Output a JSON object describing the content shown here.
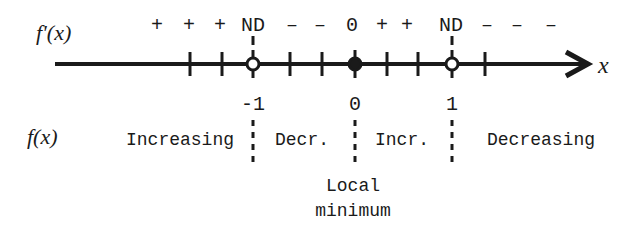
{
  "diagram": {
    "derivative_row_label": "f'(x)",
    "function_row_label": "f(x)",
    "axis_label": "x",
    "sign_row": [
      {
        "text": "+",
        "x": 157
      },
      {
        "text": "+",
        "x": 189
      },
      {
        "text": "+",
        "x": 220
      },
      {
        "text": "ND",
        "x": 253
      },
      {
        "text": "–",
        "x": 292
      },
      {
        "text": "–",
        "x": 320
      },
      {
        "text": "0",
        "x": 352
      },
      {
        "text": "+",
        "x": 382
      },
      {
        "text": "+",
        "x": 407
      },
      {
        "text": "ND",
        "x": 451
      },
      {
        "text": "–",
        "x": 487
      },
      {
        "text": "–",
        "x": 517
      },
      {
        "text": "–",
        "x": 551
      }
    ],
    "ticks_x": [
      190,
      222,
      290,
      322,
      387,
      418,
      485
    ],
    "critical_points": [
      {
        "value": "-1",
        "x": 253,
        "type": "open",
        "fprime": "ND"
      },
      {
        "value": "0",
        "x": 355,
        "type": "filled",
        "fprime": "0"
      },
      {
        "value": "1",
        "x": 452,
        "type": "open",
        "fprime": "ND"
      }
    ],
    "intervals": [
      {
        "text": "Increasing",
        "x": 180
      },
      {
        "text": "Decr.",
        "x": 302
      },
      {
        "text": "Incr.",
        "x": 402
      },
      {
        "text": "Decreasing",
        "x": 541
      }
    ],
    "annotation": {
      "line1": "Local",
      "line2": "minimum",
      "x": 353
    }
  }
}
